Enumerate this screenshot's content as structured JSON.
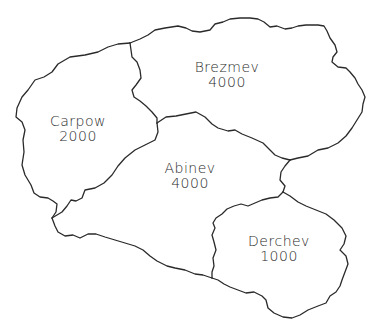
{
  "map": {
    "regions": [
      {
        "name": "Brezmev",
        "value": "4000"
      },
      {
        "name": "Carpow",
        "value": "2000"
      },
      {
        "name": "Abinev",
        "value": "4000"
      },
      {
        "name": "Derchev",
        "value": "1000"
      }
    ]
  },
  "colors": {
    "border": "#2a2a2a",
    "background": "#ffffff"
  }
}
